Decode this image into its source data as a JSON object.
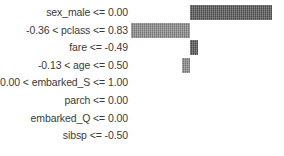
{
  "chart_data": {
    "type": "bar",
    "orientation": "horizontal",
    "title": "",
    "subtitle": "",
    "xlabel": "",
    "ylabel": "",
    "grid": false,
    "legend": null,
    "zero_line_x_px": 190,
    "axis_visible": false,
    "tick_labels_visible": false,
    "categories": [
      "sex_male <= 0.00",
      "-0.36 < pclass <= 0.83",
      "fare <= -0.49",
      "-0.13 < age <= 0.50",
      "0.00 < embarked_S <= 1.00",
      "parch <= 0.00",
      "embarked_Q <= 0.00",
      "sibsp <= -0.50"
    ],
    "values": [
      0.41,
      -0.295,
      0.035,
      -0.04,
      0.0,
      0.0,
      0.0,
      0.0
    ],
    "xlim": [
      -0.47,
      0.47
    ],
    "colors": {
      "positive": "#565656",
      "negative": "#8b8b8b",
      "background": "#ffffff",
      "label_text": "#3a3a3a"
    },
    "bars": [
      {
        "label": "sex_male <= 0.00",
        "value": 0.41,
        "sign": "positive",
        "left_px": 190.0,
        "width_px": 82.0,
        "visible": true
      },
      {
        "label": "-0.36 < pclass <= 0.83",
        "value": -0.295,
        "sign": "negative",
        "left_px": 131.0,
        "width_px": 59.0,
        "visible": true
      },
      {
        "label": "fare <= -0.49",
        "value": 0.035,
        "sign": "positive",
        "left_px": 190.0,
        "width_px": 7.5,
        "visible": true
      },
      {
        "label": "-0.13 < age <= 0.50",
        "value": -0.04,
        "sign": "negative",
        "left_px": 182.0,
        "width_px": 8.0,
        "visible": true
      },
      {
        "label": "0.00 < embarked_S <= 1.00",
        "value": 0.0,
        "sign": "none",
        "left_px": 190.0,
        "width_px": 0.0,
        "visible": false
      },
      {
        "label": "parch <= 0.00",
        "value": 0.0,
        "sign": "none",
        "left_px": 190.0,
        "width_px": 0.0,
        "visible": false
      },
      {
        "label": "embarked_Q <= 0.00",
        "value": 0.0,
        "sign": "none",
        "left_px": 190.0,
        "width_px": 0.0,
        "visible": false
      },
      {
        "label": "sibsp <= -0.50",
        "value": 0.0,
        "sign": "none",
        "left_px": 190.0,
        "width_px": 0.0,
        "visible": false
      }
    ]
  }
}
